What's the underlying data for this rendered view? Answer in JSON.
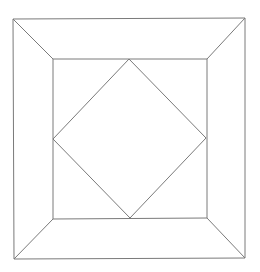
{
  "diagram": {
    "stroke_color": "#7a7a7a",
    "stroke_width": 1,
    "background": "#ffffff",
    "outer_square": {
      "top_left": [
        13,
        19
      ],
      "top_right": [
        245,
        18
      ],
      "bottom_right": [
        245,
        258
      ],
      "bottom_left": [
        14,
        259
      ]
    },
    "inner_square": {
      "top_left": [
        53,
        59
      ],
      "top_right": [
        207,
        59
      ],
      "bottom_right": [
        207,
        218
      ],
      "bottom_left": [
        53,
        219
      ]
    },
    "diamond": {
      "top": [
        129,
        59
      ],
      "right": [
        206,
        138
      ],
      "bottom": [
        130,
        218
      ],
      "left": [
        53,
        139
      ]
    }
  }
}
